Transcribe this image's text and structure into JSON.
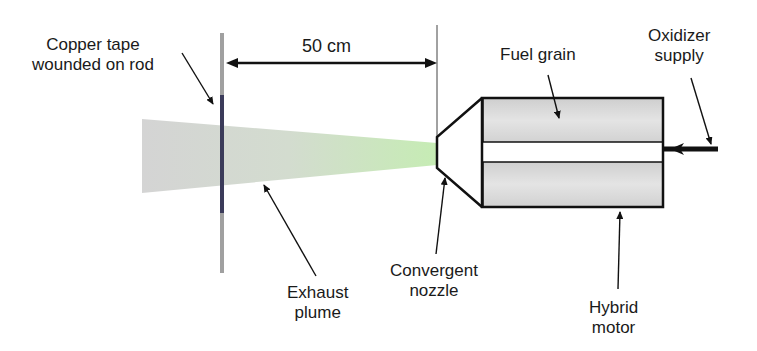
{
  "diagram": {
    "labels": {
      "copper_tape": [
        "Copper tape",
        "wounded on rod"
      ],
      "distance": "50 cm",
      "fuel_grain": "Fuel grain",
      "oxidizer_supply": [
        "Oxidizer",
        "supply"
      ],
      "exhaust_plume": [
        "Exhaust",
        "plume"
      ],
      "convergent_nozzle": [
        "Convergent",
        "nozzle"
      ],
      "hybrid_motor": [
        "Hybrid",
        "motor"
      ]
    },
    "colors": {
      "outline": "#111111",
      "rod_gray": "#9a9a9a",
      "rod_tape": "#3b3b5a",
      "plume_start": "#d2d2d2",
      "plume_end": "#c8ecb8",
      "grain_fill": "#d6d6d6"
    }
  }
}
